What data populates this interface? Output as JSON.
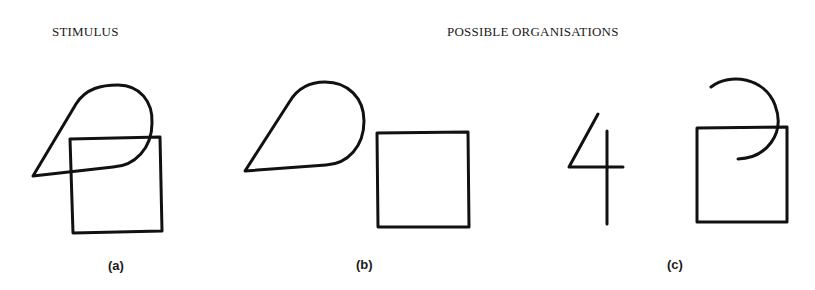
{
  "headings": {
    "stimulus": "STIMULUS",
    "organisations": "POSSIBLE ORGANISATIONS"
  },
  "panels": [
    {
      "id": "a",
      "label": "(a)",
      "description": "Overlapping teardrop shape and square (stimulus)"
    },
    {
      "id": "b",
      "label": "(b)",
      "description": "Separated teardrop shape and square"
    },
    {
      "id": "c",
      "label": "(c)",
      "description": "Figure '4' and square with an arc"
    }
  ],
  "colors": {
    "stroke": "#111111",
    "background": "#ffffff"
  }
}
